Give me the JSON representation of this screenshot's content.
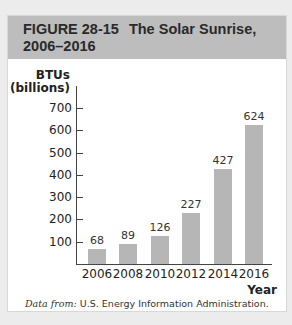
{
  "figure": {
    "label": "FIGURE 28-15",
    "title": "The Solar Sunrise,",
    "title_line2": "2006–2016",
    "source_prefix": "Data from:",
    "source_text": "U.S. Energy Information Administration."
  },
  "chart_data": {
    "type": "bar",
    "categories": [
      "2006",
      "2008",
      "2010",
      "2012",
      "2014",
      "2016"
    ],
    "values": [
      68,
      89,
      126,
      227,
      427,
      624
    ],
    "value_labels": [
      "68",
      "89",
      "126",
      "227",
      "427",
      "624"
    ],
    "xlabel": "Year",
    "ylabel": "BTUs (billions)",
    "ylabel_line1": "BTUs",
    "ylabel_line2": "(billions)",
    "yticks": [
      "100",
      "200",
      "300",
      "400",
      "500",
      "600",
      "700"
    ],
    "ylim": [
      0,
      700
    ],
    "grid": false,
    "legend": null,
    "bar_color": "#b6b6b6",
    "source": "Data from: U.S. Energy Information Administration."
  }
}
